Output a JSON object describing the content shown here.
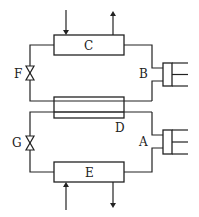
{
  "diagram": {
    "type": "refrigeration / heat-pump cycle schematic",
    "components": [
      {
        "id": "C",
        "label": "C",
        "kind": "heat-exchanger (top)"
      },
      {
        "id": "D",
        "label": "D",
        "kind": "regenerative heat-exchanger (middle)"
      },
      {
        "id": "E",
        "label": "E",
        "kind": "heat-exchanger (bottom)"
      },
      {
        "id": "F",
        "label": "F",
        "kind": "valve"
      },
      {
        "id": "G",
        "label": "G",
        "kind": "valve"
      },
      {
        "id": "B",
        "label": "B",
        "kind": "piston-cylinder"
      },
      {
        "id": "A",
        "label": "A",
        "kind": "piston-cylinder"
      }
    ],
    "flows": [
      {
        "at": "C",
        "direction": "in",
        "side": "top"
      },
      {
        "at": "C",
        "direction": "out",
        "side": "top"
      },
      {
        "at": "E",
        "direction": "in",
        "side": "bottom"
      },
      {
        "at": "E",
        "direction": "out",
        "side": "bottom"
      }
    ]
  }
}
